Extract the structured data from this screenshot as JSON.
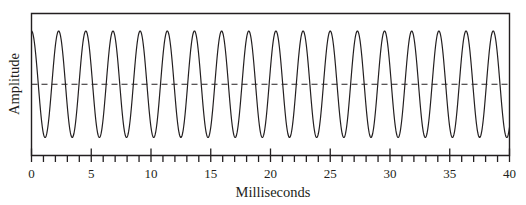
{
  "chart_data": {
    "type": "line",
    "title": "",
    "xlabel": "Milliseconds",
    "ylabel": "Amplitude",
    "xlim": [
      0,
      40
    ],
    "ylim": [
      -1.2,
      1.2
    ],
    "x_major_ticks": [
      0,
      5,
      10,
      15,
      20,
      25,
      30,
      35,
      40
    ],
    "x_tick_labels": [
      "0",
      "5",
      "10",
      "15",
      "20",
      "25",
      "30",
      "35",
      "40"
    ],
    "x_minor_tick_step": 1,
    "y_ticks": [],
    "grid": false,
    "legend": null,
    "series": [
      {
        "name": "waveform",
        "function": "cosine",
        "frequency_hz": 440,
        "period_ms": 2.2727,
        "amplitude": 1,
        "phase_start": "maximum at t=0",
        "cycles_shown": 17.6,
        "style": "solid",
        "color": "#231f20"
      }
    ],
    "reference_lines": [
      {
        "name": "zero-amplitude-line",
        "y": 0,
        "style": "dashed",
        "color": "#231f20"
      }
    ]
  },
  "colors": {
    "ink": "#231f20",
    "background": "#ffffff"
  }
}
